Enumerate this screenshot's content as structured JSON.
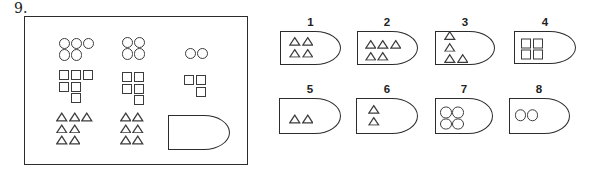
{
  "question": {
    "number_label": "9."
  },
  "matrix": {
    "cells": [
      {
        "id": "r1c1",
        "shape": "circle",
        "rows": [
          {
            "n": 3
          },
          {
            "n": 2
          }
        ]
      },
      {
        "id": "r1c2",
        "shape": "circle",
        "rows": [
          {
            "n": 2
          },
          {
            "n": 2
          }
        ]
      },
      {
        "id": "r1c3",
        "shape": "circle",
        "rows": [
          {
            "n": 2
          }
        ]
      },
      {
        "id": "r2c1",
        "shape": "square",
        "rows": [
          {
            "n": 3
          },
          {
            "n": 2
          },
          {
            "n": 1,
            "indent": 1
          }
        ]
      },
      {
        "id": "r2c2",
        "shape": "square",
        "rows": [
          {
            "n": 2
          },
          {
            "n": 2
          },
          {
            "n": 1,
            "indent": 1
          }
        ]
      },
      {
        "id": "r2c3",
        "shape": "square",
        "rows": [
          {
            "n": 2
          },
          {
            "n": 1,
            "indent": 1
          }
        ]
      },
      {
        "id": "r3c1",
        "shape": "triangle",
        "rows": [
          {
            "n": 3
          },
          {
            "n": 2
          },
          {
            "n": 2
          }
        ]
      },
      {
        "id": "r3c2",
        "shape": "triangle",
        "rows": [
          {
            "n": 2
          },
          {
            "n": 2
          },
          {
            "n": 2
          }
        ]
      },
      {
        "id": "r3c3",
        "shape": "placeholder",
        "rows": []
      }
    ]
  },
  "options": [
    {
      "label": "1",
      "shape": "triangle",
      "rows": [
        {
          "n": 2
        },
        {
          "n": 2
        }
      ],
      "align": "center"
    },
    {
      "label": "2",
      "shape": "triangle",
      "rows": [
        {
          "n": 3
        },
        {
          "n": 2
        }
      ],
      "align": "center"
    },
    {
      "label": "3",
      "shape": "triangle",
      "rows": [
        {
          "n": 1
        },
        {
          "n": 1
        },
        {
          "n": 2
        }
      ],
      "align": "center"
    },
    {
      "label": "4",
      "shape": "square",
      "rows": [
        {
          "n": 2
        },
        {
          "n": 2
        }
      ],
      "align": "center"
    },
    {
      "label": "5",
      "shape": "triangle",
      "rows": [
        {
          "n": 2
        }
      ],
      "align": "bottom"
    },
    {
      "label": "6",
      "shape": "triangle",
      "rows": [
        {
          "n": 1
        },
        {
          "n": 1
        }
      ],
      "align": "center"
    },
    {
      "label": "7",
      "shape": "circle",
      "rows": [
        {
          "n": 2
        },
        {
          "n": 2
        }
      ],
      "align": "center"
    },
    {
      "label": "8",
      "shape": "circle",
      "rows": [
        {
          "n": 2
        }
      ],
      "align": "center"
    }
  ]
}
